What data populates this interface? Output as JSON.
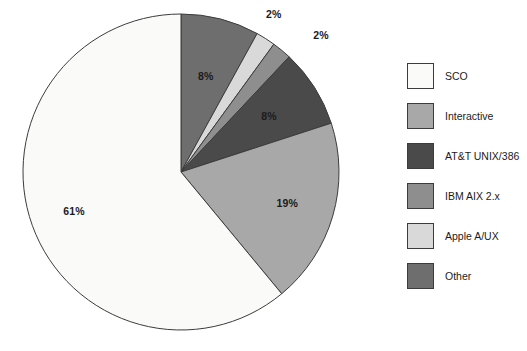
{
  "chart_data": {
    "type": "pie",
    "title": "",
    "subtitle": "",
    "xlabel": "",
    "ylabel": "",
    "legend_position": "right",
    "grid": false,
    "start_angle_deg": 0,
    "direction": "clockwise",
    "categories": [
      "Other",
      "Apple A/UX",
      "IBM AIX 2.x",
      "AT&T UNIX/386",
      "Interactive",
      "SCO"
    ],
    "values": [
      8,
      2,
      2,
      8,
      19,
      61
    ],
    "unit": "%",
    "slices": [
      {
        "label": "Other",
        "value": 8,
        "value_label": "8%",
        "color": "#6e6e6e",
        "start_deg": 0,
        "end_deg": 28.8,
        "label_inside": true
      },
      {
        "label": "Apple A/UX",
        "value": 2,
        "value_label": "2%",
        "color": "#d9d9d9",
        "start_deg": 28.8,
        "end_deg": 36.0,
        "label_inside": false
      },
      {
        "label": "IBM AIX 2.x",
        "value": 2,
        "value_label": "2%",
        "color": "#8e8e8e",
        "start_deg": 36.0,
        "end_deg": 43.2,
        "label_inside": false
      },
      {
        "label": "AT&T UNIX/386",
        "value": 8,
        "value_label": "8%",
        "color": "#4a4a4a",
        "start_deg": 43.2,
        "end_deg": 72.0,
        "label_inside": true
      },
      {
        "label": "Interactive",
        "value": 19,
        "value_label": "19%",
        "color": "#a8a8a8",
        "start_deg": 72.0,
        "end_deg": 140.4,
        "label_inside": true
      },
      {
        "label": "SCO",
        "value": 61,
        "value_label": "61%",
        "color": "#fafaf8",
        "start_deg": 140.4,
        "end_deg": 360.0,
        "label_inside": true
      }
    ],
    "value_labels": [
      "8%",
      "2%",
      "2%",
      "8%",
      "19%",
      "61%"
    ],
    "outline_color": "#3c3c3c"
  },
  "legend": {
    "items": [
      {
        "label": "SCO",
        "color": "#fafaf8"
      },
      {
        "label": "Interactive",
        "color": "#a8a8a8"
      },
      {
        "label": "AT&T UNIX/386",
        "color": "#4a4a4a"
      },
      {
        "label": "IBM AIX 2.x",
        "color": "#8e8e8e"
      },
      {
        "label": "Apple A/UX",
        "color": "#d9d9d9"
      },
      {
        "label": "Other",
        "color": "#6e6e6e"
      }
    ]
  }
}
